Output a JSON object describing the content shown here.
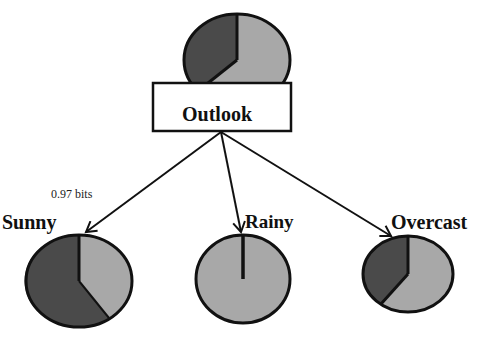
{
  "colors": {
    "dark": "#4a4a4a",
    "light": "#a8a8a8",
    "stroke": "#111111",
    "background": "#ffffff"
  },
  "root": {
    "label": "Outlook",
    "pie": {
      "dark_fraction": 0.36,
      "light_fraction": 0.64
    }
  },
  "children": [
    {
      "label": "Sunny",
      "annotation": "0.97 bits",
      "pie": {
        "dark_fraction": 0.6,
        "light_fraction": 0.4
      }
    },
    {
      "label": "Rainy",
      "pie": {
        "dark_fraction": 0.0,
        "light_fraction": 1.0
      }
    },
    {
      "label": "Overcast",
      "pie": {
        "dark_fraction": 0.4,
        "light_fraction": 0.6
      }
    }
  ]
}
